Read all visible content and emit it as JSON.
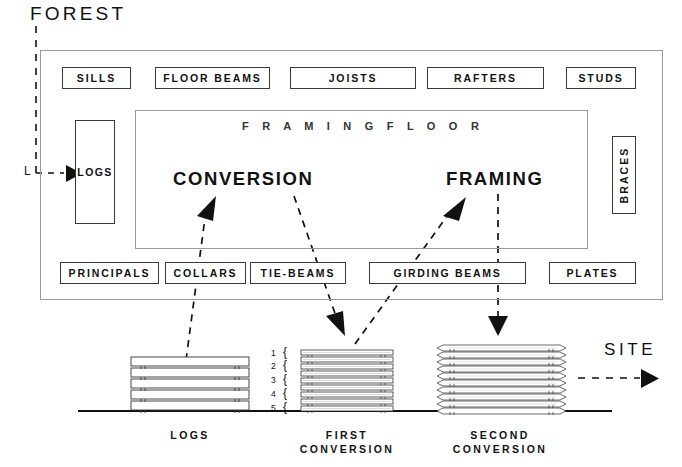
{
  "diagram": {
    "source_label": "FOREST",
    "destination_label": "SITE",
    "elbow_marker": "L",
    "logs_store_label": "LOGS",
    "braces_label": "BRACES",
    "framing_floor_label": "F R A M I N G    F L O O R",
    "process_words": [
      {
        "id": "conversion",
        "label": "CONVERSION"
      },
      {
        "id": "framing",
        "label": "FRAMING"
      }
    ],
    "top_boxes": [
      {
        "label": "SILLS",
        "x": 62,
        "y": 67,
        "w": 69,
        "h": 22
      },
      {
        "label": "FLOOR BEAMS",
        "x": 155,
        "y": 67,
        "w": 115,
        "h": 22
      },
      {
        "label": "JOISTS",
        "x": 290,
        "y": 67,
        "w": 126,
        "h": 22
      },
      {
        "label": "RAFTERS",
        "x": 427,
        "y": 67,
        "w": 117,
        "h": 22
      },
      {
        "label": "STUDS",
        "x": 566,
        "y": 67,
        "w": 70,
        "h": 22
      }
    ],
    "bottom_boxes": [
      {
        "label": "PRINCIPALS",
        "x": 60,
        "y": 262,
        "w": 99,
        "h": 22
      },
      {
        "label": "COLLARS",
        "x": 165,
        "y": 262,
        "w": 81,
        "h": 22
      },
      {
        "label": "TIE-BEAMS",
        "x": 250,
        "y": 262,
        "w": 96,
        "h": 22
      },
      {
        "label": "GIRDING  BEAMS",
        "x": 369,
        "y": 262,
        "w": 157,
        "h": 22
      },
      {
        "label": "PLATES",
        "x": 549,
        "y": 262,
        "w": 87,
        "h": 22
      }
    ],
    "stacks": [
      {
        "id": "logs",
        "caption_lines": [
          "LOGS"
        ],
        "boards": 5,
        "style": "log"
      },
      {
        "id": "first-conversion",
        "caption_lines": [
          "FIRST",
          "CONVERSION"
        ],
        "boards": 10,
        "style": "sawn"
      },
      {
        "id": "second-conversion",
        "caption_lines": [
          "SECOND",
          "CONVERSION"
        ],
        "boards": 10,
        "style": "planed"
      }
    ],
    "stack_numbers": [
      "1",
      "2",
      "3",
      "4",
      "5"
    ],
    "stack_brace_glyph": "{",
    "colors": {
      "ink": "#111111",
      "rule": "#9a9a9a",
      "box_stroke": "#3a3a3a",
      "background": "#ffffff"
    }
  }
}
